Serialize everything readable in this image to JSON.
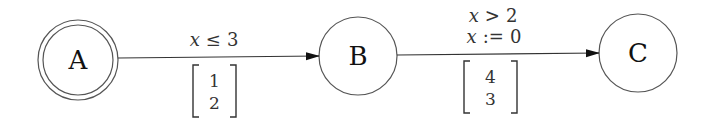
{
  "diagram": {
    "type": "automaton",
    "colors": {
      "stroke": "#555555",
      "text": "#111111",
      "edge": "#333333",
      "background": "#ffffff"
    },
    "nodes": [
      {
        "id": "A",
        "label": "A",
        "accepting": true
      },
      {
        "id": "B",
        "label": "B",
        "accepting": false
      },
      {
        "id": "C",
        "label": "C",
        "accepting": false
      }
    ],
    "edges": [
      {
        "from": "A",
        "to": "B",
        "guards": [
          {
            "var": "x",
            "op": "≤",
            "val": "3"
          }
        ],
        "vector": [
          "1",
          "2"
        ]
      },
      {
        "from": "B",
        "to": "C",
        "guards": [
          {
            "var": "x",
            "op": ">",
            "val": "2"
          },
          {
            "var": "x",
            "op": ":=",
            "val": "0"
          }
        ],
        "vector": [
          "4",
          "3"
        ]
      }
    ]
  }
}
